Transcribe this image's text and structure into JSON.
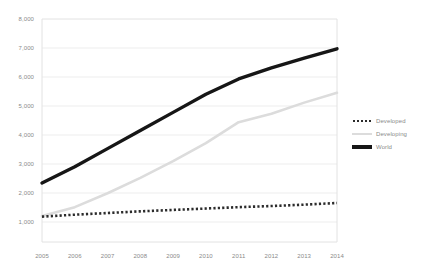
{
  "chart_data": {
    "type": "line",
    "title": "",
    "subtitle": "",
    "xlabel": "",
    "ylabel": "",
    "x": [
      2005,
      2006,
      2007,
      2008,
      2009,
      2010,
      2011,
      2012,
      2013,
      2014
    ],
    "categories": [
      "2005",
      "2006",
      "2007",
      "2008",
      "2009",
      "2010",
      "2011",
      "2012",
      "2013",
      "2014"
    ],
    "series": [
      {
        "name": "Developed",
        "style": "dotted",
        "color": "#2b2b2b",
        "values": [
          910,
          980,
          1040,
          1100,
          1150,
          1200,
          1250,
          1290,
          1340,
          1400
        ]
      },
      {
        "name": "Developing",
        "style": "solid",
        "color": "#dcdcdc",
        "values": [
          930,
          1250,
          1750,
          2300,
          2900,
          3550,
          4300,
          4600,
          5000,
          5350
        ]
      },
      {
        "name": "World",
        "style": "solid-thick",
        "color": "#161616",
        "values": [
          2120,
          2700,
          3350,
          4000,
          4650,
          5300,
          5850,
          6250,
          6600,
          6930
        ]
      }
    ],
    "ylim": [
      0,
      8000
    ],
    "xlim": [
      2005,
      2014
    ],
    "yticks": [
      1000,
      2000,
      3000,
      4000,
      5000,
      6000,
      7000,
      8000
    ],
    "ytick_labels": [
      "1,000",
      "2,000",
      "3,000",
      "4,000",
      "5,000",
      "6,000",
      "7,000",
      "8,000"
    ],
    "grid": true,
    "grid_axis": "y",
    "legend_position": "right",
    "legend_entries": [
      "Developed",
      "Developing",
      "World"
    ]
  },
  "axis": {
    "y_labels": [
      "8,000",
      "7,000",
      "6,000",
      "5,000",
      "4,000",
      "3,000",
      "2,000",
      "1,000"
    ],
    "x_labels": [
      "2005",
      "2006",
      "2007",
      "2008",
      "2009",
      "2010",
      "2011",
      "2012",
      "2013",
      "2014"
    ]
  },
  "legend": {
    "items": [
      {
        "label": "Developed",
        "key": "dotted-line-key"
      },
      {
        "label": "Developing",
        "key": "light-line-key"
      },
      {
        "label": "World",
        "key": "bold-line-key"
      }
    ]
  },
  "colors": {
    "developed": "#2b2b2b",
    "developing": "#dcdcdc",
    "world": "#161616",
    "grid": "#ededed",
    "frame": "#e2e2e2",
    "text": "#8a8a8a"
  }
}
